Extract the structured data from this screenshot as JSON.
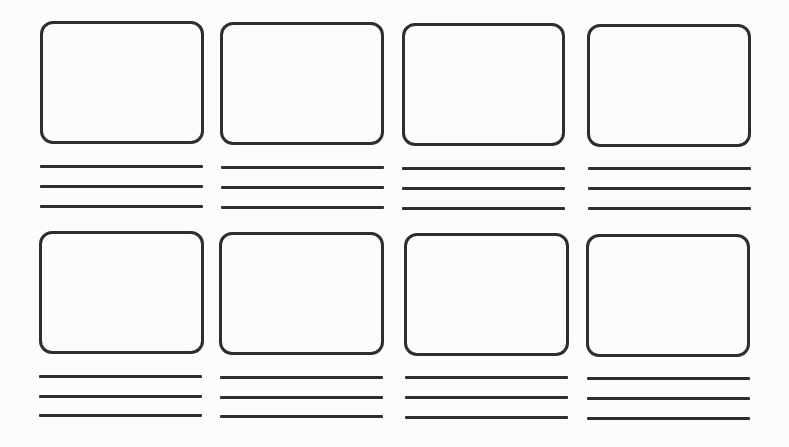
{
  "storyboard": {
    "stroke_color": "#2e2e2e",
    "background_color": "#fcfcfa",
    "rows": 2,
    "columns": 4,
    "lines_per_panel": 3,
    "panels": [
      {
        "index": 1,
        "row": 1,
        "col": 1,
        "box": [
          40,
          21,
          164,
          123
        ],
        "lines_y": [
          166,
          186,
          206
        ]
      },
      {
        "index": 2,
        "row": 1,
        "col": 2,
        "box": [
          220,
          22,
          164,
          123
        ],
        "lines_y": [
          166,
          186,
          206
        ]
      },
      {
        "index": 3,
        "row": 1,
        "col": 3,
        "box": [
          402,
          23,
          163,
          123
        ],
        "lines_y": [
          167,
          187,
          207
        ]
      },
      {
        "index": 4,
        "row": 1,
        "col": 4,
        "box": [
          587,
          24,
          164,
          123
        ],
        "lines_y": [
          167,
          188,
          208
        ]
      },
      {
        "index": 5,
        "row": 2,
        "col": 1,
        "box": [
          39,
          231,
          165,
          123
        ],
        "lines_y": [
          375,
          395,
          415
        ]
      },
      {
        "index": 6,
        "row": 2,
        "col": 2,
        "box": [
          219,
          232,
          165,
          123
        ],
        "lines_y": [
          376,
          396,
          416
        ]
      },
      {
        "index": 7,
        "row": 2,
        "col": 3,
        "box": [
          404,
          233,
          165,
          123
        ],
        "lines_y": [
          377,
          397,
          417
        ]
      },
      {
        "index": 8,
        "row": 2,
        "col": 4,
        "box": [
          586,
          234,
          164,
          123
        ],
        "lines_y": [
          378,
          398,
          418
        ]
      }
    ]
  }
}
